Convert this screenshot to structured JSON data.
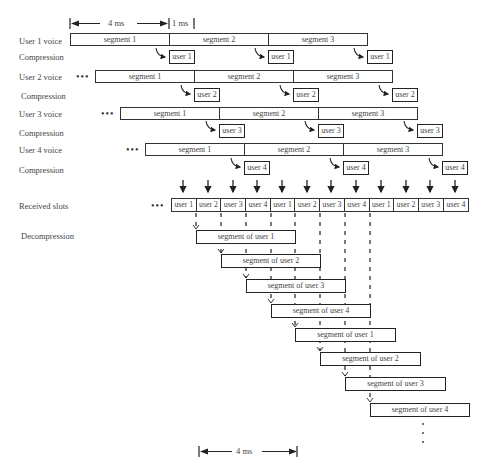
{
  "timing": {
    "top_arrow_label": "4 ms",
    "top_gap_label": "1 ms",
    "bottom_arrow_label": "4 ms"
  },
  "row_labels": {
    "user1_voice": "User 1 voice",
    "user1_compression": "Compression",
    "user2_voice": "User 2 voice",
    "user2_compression": "Compression",
    "user3_voice": "User 3 voice",
    "user3_compression": "Compression",
    "user4_voice": "User 4 voice",
    "user4_compression": "Compression",
    "received_slots": "Received slots",
    "decompression": "Decompression"
  },
  "continuation_marker": "•••",
  "voice_rows": [
    {
      "user": "user 1",
      "segments": [
        "segment 1",
        "segment 2",
        "segment 3"
      ],
      "compressed_label": "user 1"
    },
    {
      "user": "user 2",
      "segments": [
        "segment 1",
        "segment 2",
        "segment 3"
      ],
      "compressed_label": "user 2"
    },
    {
      "user": "user 3",
      "segments": [
        "segment 1",
        "segment 2",
        "segment 3"
      ],
      "compressed_label": "user 3"
    },
    {
      "user": "user 4",
      "segments": [
        "segment 1",
        "segment 2",
        "segment 3"
      ],
      "compressed_label": "user 4"
    }
  ],
  "received_slots": [
    "user 1",
    "user 2",
    "user 3",
    "user 4",
    "user 1",
    "user 2",
    "user 3",
    "user 4",
    "user 1",
    "user 2",
    "user 3",
    "user 4"
  ],
  "decompressed_segments": [
    "segment of user 1",
    "segment of user 2",
    "segment of user 3",
    "segment of user 4",
    "segment of user 1",
    "segment of user 2",
    "segment of user 3",
    "segment of user 4"
  ],
  "vertical_ellipsis": "⋮"
}
